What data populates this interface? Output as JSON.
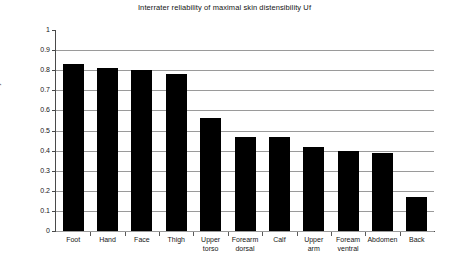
{
  "chart_data": {
    "type": "bar",
    "title": "Interrater reliability of maximal skin distensibility Uf",
    "xlabel": "",
    "ylabel": "Reliability",
    "ylim": [
      0,
      1
    ],
    "ytick_step": 0.1,
    "grid": true,
    "legend": null,
    "bar_color": "#000000",
    "categories": [
      "Foot",
      "Hand",
      "Face",
      "Thigh",
      "Upper\ntorso",
      "Forearm\ndorsal",
      "Calf",
      "Upper\narm",
      "Foream\nventral",
      "Abdomen",
      "Back"
    ],
    "values": [
      0.83,
      0.81,
      0.8,
      0.78,
      0.56,
      0.47,
      0.47,
      0.42,
      0.4,
      0.39,
      0.17
    ],
    "ytick_labels": [
      "0",
      "0.1",
      "0.2",
      "0.3",
      "0.4",
      "0.5",
      "0.6",
      "0.7",
      "0.8",
      "0.9",
      "1"
    ],
    "ytick_values": [
      0,
      0.1,
      0.2,
      0.3,
      0.4,
      0.5,
      0.6,
      0.7,
      0.8,
      0.9,
      1
    ]
  }
}
